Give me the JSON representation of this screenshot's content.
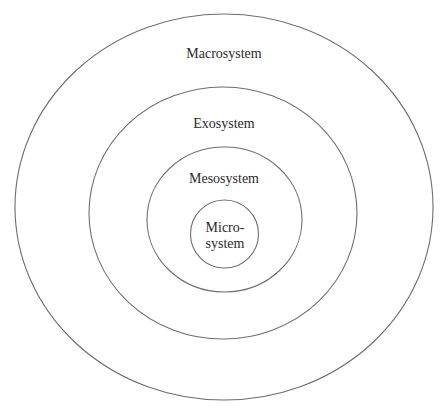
{
  "diagram": {
    "type": "nested-ellipses",
    "layers": [
      {
        "id": "macrosystem",
        "label": "Macrosystem"
      },
      {
        "id": "exosystem",
        "label": "Exosystem"
      },
      {
        "id": "mesosystem",
        "label": "Mesosystem"
      },
      {
        "id": "microsystem",
        "label_line1": "Micro-",
        "label_line2": "system"
      }
    ],
    "colors": {
      "stroke": "#6e6e6e",
      "text": "#2a2a2a",
      "background": "#ffffff"
    }
  }
}
